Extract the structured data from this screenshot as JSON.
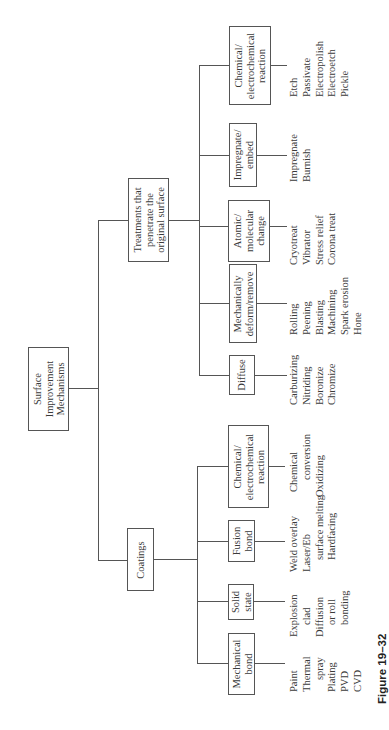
{
  "diagram": {
    "root": {
      "label_lines": [
        "Surface",
        "Improvement",
        "Mechanisms"
      ]
    },
    "branches": [
      {
        "label_lines": [
          "Treatments that",
          "penetrate the",
          "original surface"
        ],
        "children": [
          {
            "label_lines": [
              "Chemical/",
              "electrochemical",
              "reaction"
            ],
            "leaves": [
              "Etch",
              "Passivate",
              "Electropolish",
              "Electroetch",
              "Pickle"
            ]
          },
          {
            "label_lines": [
              "Impregnate/",
              "embed"
            ],
            "leaves": [
              "Impregnate",
              "Burnish"
            ]
          },
          {
            "label_lines": [
              "Atomic/",
              "molecular",
              "change"
            ],
            "leaves": [
              "Cryotreat",
              "Vibrator",
              "Stress relief",
              "Corona treat"
            ]
          },
          {
            "label_lines": [
              "Mechanically",
              "deform/remove"
            ],
            "leaves": [
              "Rolling",
              "Peening",
              "Blasting",
              "Machining",
              "Spark erosion",
              "Hone"
            ]
          },
          {
            "label_lines": [
              "Diffuse"
            ],
            "leaves": [
              "Carburizing",
              "Nitriding",
              "Boronize",
              "Chromize"
            ]
          }
        ]
      },
      {
        "label_lines": [
          "Coatings"
        ],
        "children": [
          {
            "label_lines": [
              "Chemical/",
              "electrochemical",
              "reaction"
            ],
            "leaves": [
              "Chemical",
              "conversion",
              "Oxidizing"
            ]
          },
          {
            "label_lines": [
              "Fusion",
              "bond"
            ],
            "leaves": [
              "Weld overlay",
              "Laser/Eb",
              "surface melting",
              "Hardfacing"
            ]
          },
          {
            "label_lines": [
              "Solid",
              "state"
            ],
            "leaves": [
              "Explosion",
              "clad",
              "Diffusion",
              "or roll",
              "bonding"
            ]
          },
          {
            "label_lines": [
              "Mechanical",
              "bond"
            ],
            "leaves": [
              "Paint",
              "Thermal",
              "spray",
              "Plating",
              "PVD",
              "CVD"
            ]
          }
        ]
      }
    ]
  },
  "caption": "Figure 19–32"
}
